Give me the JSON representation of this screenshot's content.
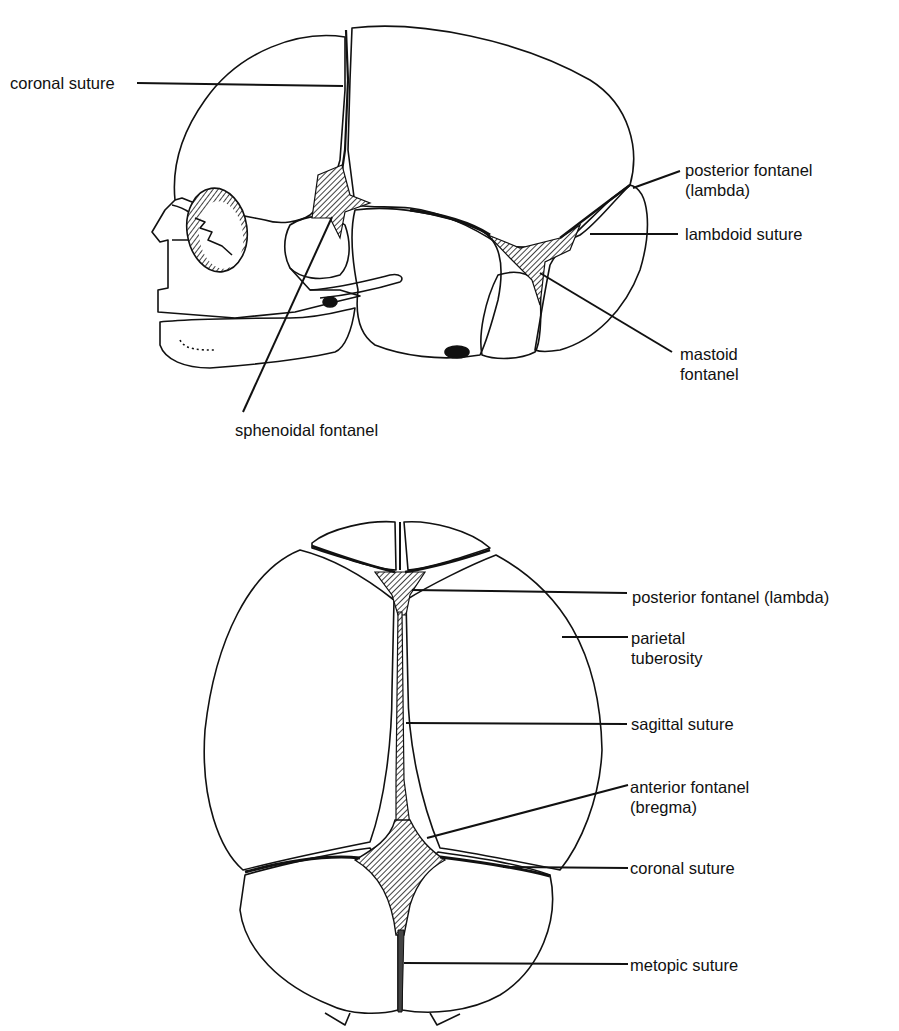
{
  "lateral_view": {
    "labels": [
      {
        "id": "coronal-suture",
        "text": "coronal suture"
      },
      {
        "id": "posterior-fontanel",
        "line1": "posterior fontanel",
        "line2": "(lambda)"
      },
      {
        "id": "lambdoid-suture",
        "text": "lambdoid suture"
      },
      {
        "id": "mastoid-fontanel",
        "line1": "mastoid",
        "line2": "fontanel"
      },
      {
        "id": "sphenoidal-fontanel",
        "text": "sphenoidal fontanel"
      }
    ]
  },
  "superior_view": {
    "labels": [
      {
        "id": "posterior-fontanel",
        "text": "posterior fontanel  (lambda)"
      },
      {
        "id": "parietal-tuberosity",
        "line1": "parietal",
        "line2": "tuberosity"
      },
      {
        "id": "sagittal-suture",
        "text": "sagittal suture"
      },
      {
        "id": "anterior-fontanel",
        "line1": "anterior fontanel",
        "line2": "(bregma)"
      },
      {
        "id": "coronal-suture",
        "text": "coronal suture"
      },
      {
        "id": "metopic-suture",
        "text": "metopic suture"
      }
    ]
  },
  "colors": {
    "ink": "#111111",
    "background": "#ffffff"
  }
}
